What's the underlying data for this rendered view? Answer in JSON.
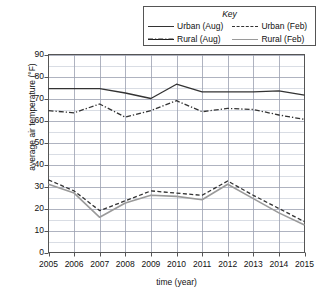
{
  "chart_data": {
    "type": "line",
    "title": "",
    "xlabel": "time (year)",
    "ylabel": "average air temperature (°F)",
    "x": [
      2005,
      2006,
      2007,
      2008,
      2009,
      2010,
      2011,
      2012,
      2013,
      2014,
      2015
    ],
    "xticklabels": [
      "2005",
      "2006",
      "2007",
      "2008",
      "2009",
      "2010",
      "2011",
      "2012",
      "2013",
      "2014",
      "2015"
    ],
    "yticklabels": [
      "0",
      "10",
      "20",
      "30",
      "40",
      "50",
      "60",
      "70",
      "80",
      "90"
    ],
    "yticks": [
      0,
      10,
      20,
      30,
      40,
      50,
      60,
      70,
      80,
      90
    ],
    "ylim": [
      0,
      90
    ],
    "xlim": [
      2005,
      2015
    ],
    "minor_gridline_step": 5,
    "grid": true,
    "legend_position": "top-right-outside",
    "series": [
      {
        "name": "Urban (Aug)",
        "style": "solid",
        "color": "#333333",
        "values": [
          74.5,
          74.5,
          74.5,
          72.5,
          70.0,
          76.5,
          73.0,
          73.0,
          73.0,
          73.5,
          71.5
        ]
      },
      {
        "name": "Urban (Feb)",
        "style": "dashed",
        "color": "#333333",
        "values": [
          33.0,
          28.0,
          19.0,
          23.5,
          28.0,
          27.0,
          26.0,
          32.5,
          26.0,
          20.0,
          14.0
        ]
      },
      {
        "name": "Rural (Aug)",
        "style": "dashdot",
        "color": "#333333",
        "values": [
          64.5,
          63.5,
          67.5,
          61.5,
          64.5,
          69.0,
          64.0,
          65.5,
          65.0,
          62.5,
          60.5
        ]
      },
      {
        "name": "Rural (Feb)",
        "style": "solid",
        "color": "#9a9a9a",
        "values": [
          31.0,
          27.0,
          16.0,
          22.5,
          26.0,
          25.5,
          24.0,
          31.0,
          24.5,
          18.0,
          12.5
        ]
      }
    ]
  },
  "legend": {
    "title": "Key",
    "entries": [
      {
        "label": "Urban (Aug)",
        "swatch": "solid-dark"
      },
      {
        "label": "Urban (Feb)",
        "swatch": "dashed-dark"
      },
      {
        "label": "Rural (Aug)",
        "swatch": "dashdot"
      },
      {
        "label": "Rural (Feb)",
        "swatch": "solid-gray"
      }
    ]
  },
  "colors": {
    "dark_line": "#333333",
    "gray_line": "#9a9a9a",
    "grid_major": "#9aa0b0",
    "grid_minor": "#c9ced8",
    "axis": "#555555",
    "background": "#ffffff"
  }
}
